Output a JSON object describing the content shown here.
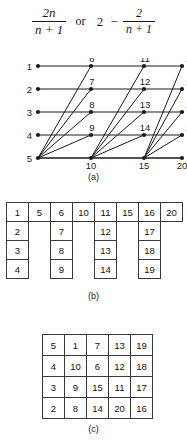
{
  "formula": {
    "expr1": {
      "numerator": "2n",
      "denominator": "n + 1"
    },
    "operator": "or",
    "expr2_lead": "2",
    "expr2_minus": "−",
    "expr2_frac": {
      "numerator": "2",
      "denominator": "n + 1"
    }
  },
  "captions": {
    "a": "(a)",
    "b": "(b)",
    "c": "(c)"
  },
  "diagram_a": {
    "groups": [
      {
        "labels": [
          "1",
          "2",
          "3",
          "4",
          "5"
        ]
      },
      {
        "labels": [
          "6",
          "7",
          "8",
          "9",
          "10"
        ]
      },
      {
        "labels": [
          "11",
          "12",
          "13",
          "14",
          "15"
        ]
      },
      {
        "labels": [
          "16",
          "17",
          "18",
          "19",
          "20"
        ]
      }
    ],
    "node_count": 20
  },
  "table_b": {
    "columns": [
      {
        "cells": [
          "1",
          "2",
          "3",
          "4"
        ]
      },
      {
        "cells": [
          "5"
        ]
      },
      {
        "cells": [
          "6",
          "7",
          "8",
          "9"
        ]
      },
      {
        "cells": [
          "10"
        ]
      },
      {
        "cells": [
          "11",
          "12",
          "13",
          "14"
        ]
      },
      {
        "cells": [
          "15"
        ]
      },
      {
        "cells": [
          "16",
          "17",
          "18",
          "19"
        ]
      },
      {
        "cells": [
          "20"
        ]
      }
    ]
  },
  "table_c": {
    "rows": [
      [
        "5",
        "1",
        "7",
        "13",
        "19"
      ],
      [
        "4",
        "10",
        "6",
        "12",
        "18"
      ],
      [
        "3",
        "9",
        "15",
        "11",
        "17"
      ],
      [
        "2",
        "8",
        "14",
        "20",
        "16"
      ]
    ]
  },
  "colors": {
    "ink": "#1a1a1a",
    "rule": "#3a3a3a",
    "background": "#ffffff"
  }
}
